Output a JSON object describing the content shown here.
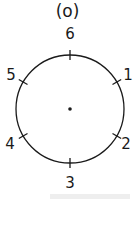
{
  "title": "(o)",
  "diagram": {
    "type": "circle-with-divisions",
    "center_dot": true,
    "labels": [
      {
        "text": "6",
        "position": "top"
      },
      {
        "text": "1",
        "position": "upper-right"
      },
      {
        "text": "2",
        "position": "lower-right"
      },
      {
        "text": "3",
        "position": "bottom"
      },
      {
        "text": "4",
        "position": "lower-left"
      },
      {
        "text": "5",
        "position": "upper-left"
      }
    ]
  }
}
